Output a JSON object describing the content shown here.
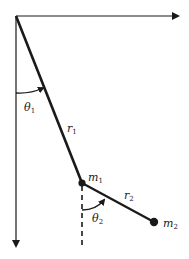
{
  "diagram": {
    "colors": {
      "ink": "#1a1a1a",
      "background": "#ffffff"
    },
    "labels": {
      "theta1": {
        "symbol": "θ",
        "sub": "1"
      },
      "theta2": {
        "symbol": "θ",
        "sub": "2"
      },
      "r1": {
        "symbol": "r",
        "sub": "1"
      },
      "r2": {
        "symbol": "r",
        "sub": "2"
      },
      "m1": {
        "symbol": "m",
        "sub": "1"
      },
      "m2": {
        "symbol": "m",
        "sub": "2"
      }
    },
    "nodes": {
      "origin": {
        "x": 16,
        "y": 16
      },
      "m1": {
        "x": 82,
        "y": 183
      },
      "m2": {
        "x": 154,
        "y": 222
      }
    },
    "axes": {
      "x_axis": {
        "from": [
          16,
          16
        ],
        "to": [
          180,
          16
        ],
        "direction": "right"
      },
      "y_axis": {
        "from": [
          16,
          16
        ],
        "to": [
          16,
          248
        ],
        "direction": "down"
      }
    }
  }
}
